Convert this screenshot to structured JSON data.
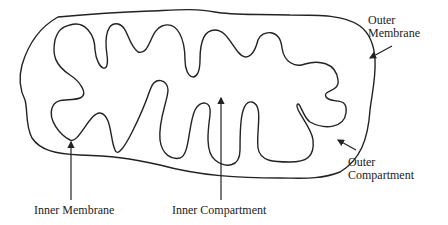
{
  "diagram": {
    "stroke_color": "#222222",
    "labels": {
      "outer_membrane": [
        "Outer",
        "Membrane"
      ],
      "outer_compartment": [
        "Outer",
        "Compartment"
      ],
      "inner_membrane": "Inner Membrane",
      "inner_compartment": "Inner Compartment"
    }
  }
}
